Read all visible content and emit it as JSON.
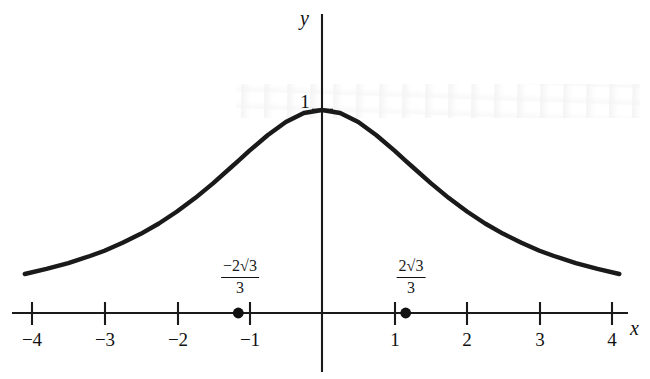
{
  "figure": {
    "kind": "cartesian-graph",
    "background_color": "#ffffff",
    "ink_color": "#1a1a1a",
    "axis_labels": {
      "x": "x",
      "y": "y"
    },
    "y_axis_tick_labels": [
      "1"
    ],
    "x_axis_tick_labels": [
      "−4",
      "−3",
      "−2",
      "−1",
      "1",
      "2",
      "3",
      "4"
    ],
    "annotations": [
      {
        "name": "left-inflection-label",
        "numerator": "−2√3",
        "denominator": "3",
        "x_value": -1.1547
      },
      {
        "name": "right-inflection-label",
        "numerator": "2√3",
        "denominator": "3",
        "x_value": 1.1547
      }
    ]
  },
  "chart_data": {
    "type": "line",
    "title": "",
    "xlabel": "x",
    "ylabel": "y",
    "xlim": [
      -4.1,
      4.1
    ],
    "ylim": [
      0,
      1.05
    ],
    "xticks": [
      -4,
      -3,
      -2,
      -1,
      1,
      2,
      3,
      4
    ],
    "xticklabels": [
      "−4",
      "−3",
      "−2",
      "−1",
      "1",
      "2",
      "3",
      "4"
    ],
    "yticks": [
      1
    ],
    "yticklabels": [
      "1"
    ],
    "grid": false,
    "legend": null,
    "series": [
      {
        "name": "bell curve",
        "x": [
          -4.1,
          -3.8,
          -3.5,
          -3.2,
          -3.0,
          -2.75,
          -2.5,
          -2.25,
          -2.0,
          -1.75,
          -1.5,
          -1.25,
          -1.1547,
          -1.0,
          -0.75,
          -0.5,
          -0.25,
          0.0,
          0.25,
          0.5,
          0.75,
          1.0,
          1.1547,
          1.25,
          1.5,
          1.75,
          2.0,
          2.25,
          2.5,
          2.75,
          3.0,
          3.2,
          3.5,
          3.8,
          4.1
        ],
        "y": [
          0.192,
          0.217,
          0.246,
          0.281,
          0.307,
          0.346,
          0.39,
          0.441,
          0.5,
          0.566,
          0.64,
          0.719,
          0.75,
          0.8,
          0.876,
          0.941,
          0.985,
          1.0,
          0.985,
          0.941,
          0.876,
          0.8,
          0.75,
          0.719,
          0.64,
          0.566,
          0.5,
          0.441,
          0.39,
          0.346,
          0.307,
          0.281,
          0.246,
          0.217,
          0.192
        ]
      }
    ],
    "points": [
      {
        "label": "−2√3/3",
        "x": -1.1547,
        "y": 0,
        "marker": "filled-circle"
      },
      {
        "label": "2√3/3",
        "x": 1.1547,
        "y": 0,
        "marker": "filled-circle"
      }
    ],
    "maximum_point": {
      "x": 0,
      "y": 1
    }
  }
}
